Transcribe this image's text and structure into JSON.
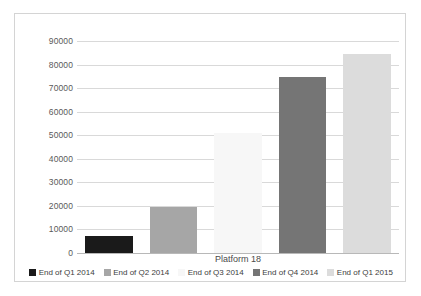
{
  "chart_data": {
    "type": "bar",
    "title": "",
    "xlabel": "Platform 18",
    "ylabel": "",
    "categories": [
      "End of Q1 2014",
      "End of Q2 2014",
      "End of Q3 2014",
      "End of Q4 2014",
      "End of Q1 2015"
    ],
    "values": [
      7300,
      19700,
      51000,
      74800,
      84500
    ],
    "colors": [
      "#1a1a1a",
      "#a6a6a6",
      "#f7f7f7",
      "#757575",
      "#dcdcdc"
    ],
    "ylim": [
      0,
      90000
    ],
    "yticks": [
      0,
      10000,
      20000,
      30000,
      40000,
      50000,
      60000,
      70000,
      80000,
      90000
    ],
    "ytick_labels": [
      "0",
      "10000",
      "20000",
      "30000",
      "40000",
      "50000",
      "60000",
      "70000",
      "80000",
      "90000"
    ],
    "grid": true,
    "legend_position": "bottom",
    "legend": [
      {
        "label": "End of Q1 2014",
        "color": "#1a1a1a"
      },
      {
        "label": "End of Q2 2014",
        "color": "#a6a6a6"
      },
      {
        "label": "End of Q3 2014",
        "color": "#f7f7f7"
      },
      {
        "label": "End of Q4 2014",
        "color": "#757575"
      },
      {
        "label": "End of Q1 2015",
        "color": "#dcdcdc"
      }
    ]
  }
}
